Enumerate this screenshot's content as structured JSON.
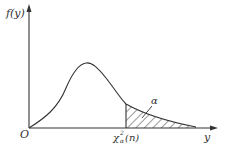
{
  "diagram": {
    "type": "chi-square density plot",
    "y_axis_label": "f(y)",
    "x_axis_label": "y",
    "origin_label": "O",
    "critical_value_label": "χ²α(n)",
    "critical_value": {
      "base": "χ",
      "superscript": "2",
      "subscript": "α",
      "arg": "(n)"
    },
    "area_label": "α",
    "colors": {
      "line": "#333333",
      "background": "#ffffff"
    }
  }
}
